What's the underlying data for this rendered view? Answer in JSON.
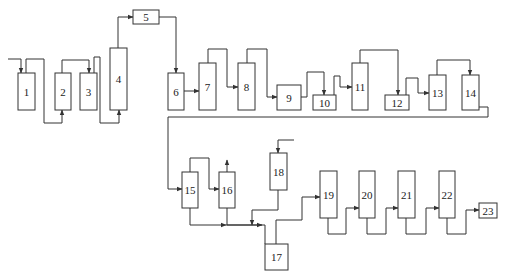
{
  "diagram": {
    "type": "process-flow",
    "colors": {
      "stroke": "#333333",
      "background": "#ffffff",
      "text": "#222222"
    },
    "units": [
      {
        "id": "1",
        "label": "1",
        "x": 18,
        "y": 73,
        "w": 17,
        "h": 37
      },
      {
        "id": "2",
        "label": "2",
        "x": 55,
        "y": 73,
        "w": 16,
        "h": 37
      },
      {
        "id": "3",
        "label": "3",
        "x": 80,
        "y": 73,
        "w": 17,
        "h": 37
      },
      {
        "id": "4",
        "label": "4",
        "x": 110,
        "y": 48,
        "w": 17,
        "h": 62
      },
      {
        "id": "5",
        "label": "5",
        "x": 133,
        "y": 10,
        "w": 26,
        "h": 14
      },
      {
        "id": "6",
        "label": "6",
        "x": 168,
        "y": 73,
        "w": 16,
        "h": 37
      },
      {
        "id": "7",
        "label": "7",
        "x": 199,
        "y": 63,
        "w": 17,
        "h": 47
      },
      {
        "id": "8",
        "label": "8",
        "x": 238,
        "y": 63,
        "w": 17,
        "h": 47
      },
      {
        "id": "9",
        "label": "9",
        "x": 277,
        "y": 85,
        "w": 24,
        "h": 25
      },
      {
        "id": "10",
        "label": "10",
        "x": 313,
        "y": 95,
        "w": 23,
        "h": 15
      },
      {
        "id": "11",
        "label": "11",
        "x": 352,
        "y": 63,
        "w": 16,
        "h": 47
      },
      {
        "id": "12",
        "label": "12",
        "x": 385,
        "y": 95,
        "w": 24,
        "h": 15
      },
      {
        "id": "13",
        "label": "13",
        "x": 429,
        "y": 75,
        "w": 17,
        "h": 35
      },
      {
        "id": "14",
        "label": "14",
        "x": 462,
        "y": 75,
        "w": 17,
        "h": 35
      },
      {
        "id": "15",
        "label": "15",
        "x": 182,
        "y": 172,
        "w": 16,
        "h": 36
      },
      {
        "id": "16",
        "label": "16",
        "x": 219,
        "y": 172,
        "w": 16,
        "h": 36
      },
      {
        "id": "17",
        "label": "17",
        "x": 265,
        "y": 244,
        "w": 23,
        "h": 26
      },
      {
        "id": "18",
        "label": "18",
        "x": 270,
        "y": 153,
        "w": 17,
        "h": 37
      },
      {
        "id": "19",
        "label": "19",
        "x": 320,
        "y": 171,
        "w": 17,
        "h": 47
      },
      {
        "id": "20",
        "label": "20",
        "x": 359,
        "y": 171,
        "w": 16,
        "h": 47
      },
      {
        "id": "21",
        "label": "21",
        "x": 398,
        "y": 171,
        "w": 17,
        "h": 47
      },
      {
        "id": "22",
        "label": "22",
        "x": 439,
        "y": 171,
        "w": 16,
        "h": 47
      },
      {
        "id": "23",
        "label": "23",
        "x": 479,
        "y": 203,
        "w": 18,
        "h": 15
      }
    ],
    "connections": [
      {
        "from": "feed",
        "to": "1",
        "points": [
          [
            8,
            59
          ],
          [
            21,
            59
          ],
          [
            21,
            73
          ]
        ],
        "arrow": true
      },
      {
        "from": "1",
        "to": "2",
        "points": [
          [
            26,
            73
          ],
          [
            26,
            59
          ],
          [
            44,
            59
          ],
          [
            44,
            123
          ],
          [
            62,
            123
          ],
          [
            62,
            110
          ]
        ],
        "arrow": true
      },
      {
        "from": "2",
        "to": "3",
        "points": [
          [
            62,
            73
          ],
          [
            62,
            60
          ],
          [
            89,
            60
          ],
          [
            89,
            73
          ]
        ],
        "arrow": true
      },
      {
        "from": "3",
        "to": "4",
        "points": [
          [
            94,
            73
          ],
          [
            94,
            57
          ],
          [
            100,
            57
          ],
          [
            100,
            123
          ],
          [
            119,
            123
          ],
          [
            119,
            110
          ]
        ],
        "arrow": true
      },
      {
        "from": "4",
        "to": "5",
        "points": [
          [
            118,
            48
          ],
          [
            118,
            17
          ],
          [
            133,
            17
          ]
        ],
        "arrow": true
      },
      {
        "from": "5",
        "to": "6",
        "points": [
          [
            159,
            17
          ],
          [
            176,
            17
          ],
          [
            176,
            73
          ]
        ],
        "arrow": true
      },
      {
        "from": "6",
        "to": "7",
        "points": [
          [
            184,
            91
          ],
          [
            199,
            91
          ]
        ],
        "arrow": true
      },
      {
        "from": "7",
        "to": "8",
        "points": [
          [
            208,
            63
          ],
          [
            208,
            49
          ],
          [
            227,
            49
          ],
          [
            227,
            87
          ],
          [
            238,
            87
          ]
        ],
        "arrow": true
      },
      {
        "from": "8",
        "to": "9",
        "points": [
          [
            247,
            63
          ],
          [
            247,
            49
          ],
          [
            267,
            49
          ],
          [
            267,
            97
          ],
          [
            277,
            97
          ]
        ],
        "arrow": true
      },
      {
        "from": "9",
        "to": "10",
        "points": [
          [
            301,
            97
          ],
          [
            307,
            97
          ],
          [
            307,
            72
          ],
          [
            324,
            72
          ],
          [
            324,
            95
          ]
        ],
        "arrow": true
      },
      {
        "from": "10",
        "to": "11",
        "points": [
          [
            334,
            95
          ],
          [
            334,
            76
          ],
          [
            340,
            76
          ],
          [
            340,
            87
          ],
          [
            352,
            87
          ]
        ],
        "arrow": true
      },
      {
        "from": "11",
        "to": "12",
        "points": [
          [
            360,
            63
          ],
          [
            360,
            50
          ],
          [
            398,
            50
          ],
          [
            398,
            95
          ]
        ],
        "arrow": true
      },
      {
        "from": "12",
        "to": "13",
        "points": [
          [
            406,
            95
          ],
          [
            406,
            78
          ],
          [
            418,
            78
          ],
          [
            418,
            93
          ],
          [
            429,
            93
          ]
        ],
        "arrow": true
      },
      {
        "from": "13",
        "to": "14",
        "points": [
          [
            437,
            75
          ],
          [
            437,
            60
          ],
          [
            470,
            60
          ],
          [
            470,
            75
          ]
        ],
        "arrow": true
      },
      {
        "from": "14",
        "to": "15",
        "points": [
          [
            479,
            107
          ],
          [
            488,
            107
          ],
          [
            488,
            117
          ],
          [
            168,
            117
          ],
          [
            168,
            189
          ],
          [
            182,
            189
          ]
        ],
        "arrow": true
      },
      {
        "from": "15",
        "to": "16",
        "points": [
          [
            190,
            172
          ],
          [
            190,
            158
          ],
          [
            209,
            158
          ],
          [
            209,
            189
          ],
          [
            219,
            189
          ]
        ],
        "arrow": true
      },
      {
        "from": "16",
        "to": "vent",
        "points": [
          [
            227,
            172
          ],
          [
            227,
            160
          ]
        ],
        "arrow": true
      },
      {
        "from": "15",
        "to": "17",
        "points": [
          [
            190,
            208
          ],
          [
            190,
            225
          ],
          [
            226,
            225
          ]
        ],
        "arrow": true
      },
      {
        "from": "16",
        "to": "17",
        "points": [
          [
            227,
            208
          ],
          [
            227,
            225
          ],
          [
            262,
            225
          ]
        ],
        "arrow": true
      },
      {
        "from": "16-merge",
        "to": "17",
        "points": [
          [
            226,
            225
          ],
          [
            265,
            225
          ],
          [
            265,
            244
          ]
        ],
        "arrow": false
      },
      {
        "from": "feed18",
        "to": "18",
        "points": [
          [
            294,
            140
          ],
          [
            278,
            140
          ],
          [
            278,
            153
          ]
        ],
        "arrow": true
      },
      {
        "from": "18",
        "to": "17",
        "points": [
          [
            278,
            190
          ],
          [
            278,
            210
          ],
          [
            252,
            210
          ],
          [
            252,
            225
          ]
        ],
        "arrow": true
      },
      {
        "from": "17",
        "to": "19",
        "points": [
          [
            276,
            244
          ],
          [
            276,
            220
          ],
          [
            302,
            220
          ],
          [
            302,
            197
          ],
          [
            320,
            197
          ]
        ],
        "arrow": true
      },
      {
        "from": "19",
        "to": "20",
        "points": [
          [
            328,
            218
          ],
          [
            328,
            234
          ],
          [
            346,
            234
          ],
          [
            346,
            208
          ],
          [
            359,
            208
          ]
        ],
        "arrow": true
      },
      {
        "from": "20",
        "to": "21",
        "points": [
          [
            367,
            218
          ],
          [
            367,
            234
          ],
          [
            386,
            234
          ],
          [
            386,
            208
          ],
          [
            398,
            208
          ]
        ],
        "arrow": true
      },
      {
        "from": "21",
        "to": "22",
        "points": [
          [
            406,
            218
          ],
          [
            406,
            234
          ],
          [
            426,
            234
          ],
          [
            426,
            208
          ],
          [
            439,
            208
          ]
        ],
        "arrow": true
      },
      {
        "from": "22",
        "to": "23",
        "points": [
          [
            447,
            218
          ],
          [
            447,
            234
          ],
          [
            466,
            234
          ],
          [
            466,
            210
          ],
          [
            479,
            210
          ]
        ],
        "arrow": true
      }
    ]
  }
}
